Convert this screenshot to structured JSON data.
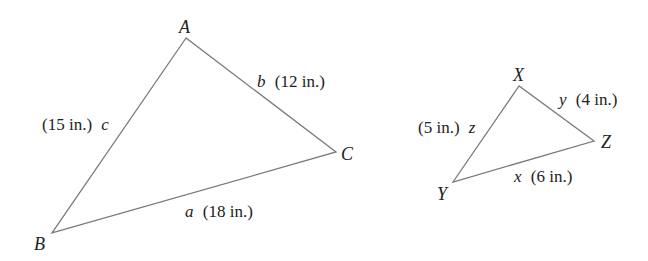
{
  "diagram": {
    "type": "similar-triangles",
    "line_color": "#7a7a7a",
    "text_color": "#222222",
    "triangles": [
      {
        "name": "ABC",
        "vertices": {
          "A": {
            "label": "A",
            "x": 186,
            "y": 38
          },
          "B": {
            "label": "B",
            "x": 52,
            "y": 233
          },
          "C": {
            "label": "C",
            "x": 336,
            "y": 152
          }
        },
        "sides": {
          "a": {
            "var": "a",
            "length": "(18 in.)",
            "between": "B-C"
          },
          "b": {
            "var": "b",
            "length": "(12 in.)",
            "between": "A-C"
          },
          "c": {
            "var": "c",
            "length": "(15 in.)",
            "between": "A-B"
          }
        }
      },
      {
        "name": "XYZ",
        "vertices": {
          "X": {
            "label": "X",
            "x": 519,
            "y": 86
          },
          "Y": {
            "label": "Y",
            "x": 453,
            "y": 182
          },
          "Z": {
            "label": "Z",
            "x": 594,
            "y": 141
          }
        },
        "sides": {
          "x": {
            "var": "x",
            "length": "(6 in.)",
            "between": "Y-Z"
          },
          "y": {
            "var": "y",
            "length": "(4 in.)",
            "between": "X-Z"
          },
          "z": {
            "var": "z",
            "length": "(5 in.)",
            "between": "X-Y"
          }
        }
      }
    ]
  }
}
